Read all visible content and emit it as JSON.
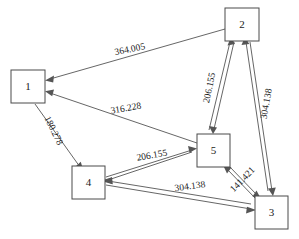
{
  "diagram": {
    "background_color": "#ffffff",
    "node_stroke_color": "#4a4a4a",
    "edge_color": "#555555",
    "text_color": "#1a1a1a",
    "nodes": [
      {
        "id": "1",
        "label": "1",
        "x": 11,
        "y": 70,
        "w": 34,
        "h": 33
      },
      {
        "id": "2",
        "label": "2",
        "x": 225,
        "y": 8,
        "w": 34,
        "h": 33
      },
      {
        "id": "3",
        "label": "3",
        "x": 255,
        "y": 196,
        "w": 33,
        "h": 33
      },
      {
        "id": "4",
        "label": "4",
        "x": 72,
        "y": 166,
        "w": 33,
        "h": 33
      },
      {
        "id": "5",
        "label": "5",
        "x": 197,
        "y": 134,
        "w": 33,
        "h": 33
      }
    ],
    "edges": [
      {
        "id": "e1",
        "from": "2",
        "to": "1",
        "weight": "364.005",
        "label_x": 130,
        "label_y": 50,
        "label_rotate": -12
      },
      {
        "id": "e2",
        "from": "5",
        "to": "1",
        "weight": "316.228",
        "label_x": 126,
        "label_y": 109,
        "label_rotate": -10
      },
      {
        "id": "e3",
        "from": "1",
        "to": "4",
        "weight": "180.278",
        "label_x": 53,
        "label_y": 131,
        "label_rotate": 64
      },
      {
        "id": "e4",
        "from": "4",
        "to": "5",
        "weight": "206.155",
        "label_x": 152,
        "label_y": 156,
        "label_rotate": -10
      },
      {
        "id": "e5",
        "from": "2",
        "to": "5",
        "weight": "206.155",
        "label_x": 210,
        "label_y": 88,
        "label_rotate": -78
      },
      {
        "id": "e6",
        "from": "2",
        "to": "3",
        "weight": "304.138",
        "label_x": 267,
        "label_y": 104,
        "label_rotate": -80
      },
      {
        "id": "e7",
        "from": "5",
        "to": "3",
        "weight": "141.421",
        "label_x": 243,
        "label_y": 180,
        "label_rotate": -46
      },
      {
        "id": "e8",
        "from": "4",
        "to": "3",
        "weight": "304.138",
        "label_x": 190,
        "label_y": 187,
        "label_rotate": -8
      }
    ]
  }
}
